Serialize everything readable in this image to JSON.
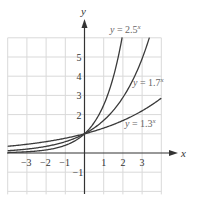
{
  "chart_data": {
    "type": "line",
    "title": "",
    "xlabel": "x",
    "ylabel": "y",
    "xlim": [
      -4,
      4
    ],
    "ylim": [
      -2,
      6
    ],
    "grid": true,
    "x_ticks": [
      "−3",
      "−2",
      "−1",
      "1",
      "2",
      "3"
    ],
    "x_tick_values": [
      -3,
      -2,
      -1,
      1,
      2,
      3
    ],
    "y_ticks": [
      "−1",
      "2",
      "3",
      "4",
      "5"
    ],
    "y_tick_values": [
      -1,
      2,
      3,
      4,
      5
    ],
    "series": [
      {
        "name": "y = 2.5^x",
        "base": 2.5,
        "label_text": "y = 2.5",
        "label_sup": "x",
        "x": [
          -4,
          -3,
          -2,
          -1,
          0,
          1,
          1.5,
          1.96
        ],
        "values": [
          0.03,
          0.06,
          0.16,
          0.4,
          1,
          2.5,
          3.95,
          6.0
        ]
      },
      {
        "name": "y = 1.7^x",
        "base": 1.7,
        "label_text": "y = 1.7",
        "label_sup": "x",
        "x": [
          -4,
          -3,
          -2,
          -1,
          0,
          1,
          2,
          3,
          3.38
        ],
        "values": [
          0.12,
          0.2,
          0.35,
          0.59,
          1,
          1.7,
          2.89,
          4.91,
          6.0
        ]
      },
      {
        "name": "y = 1.3^x",
        "base": 1.3,
        "label_text": "y = 1.3",
        "label_sup": "x",
        "x": [
          -4,
          -3,
          -2,
          -1,
          0,
          1,
          2,
          3,
          4
        ],
        "values": [
          0.35,
          0.46,
          0.59,
          0.77,
          1,
          1.3,
          1.69,
          2.2,
          2.86
        ]
      }
    ],
    "legend": "inline labels next to curves"
  }
}
